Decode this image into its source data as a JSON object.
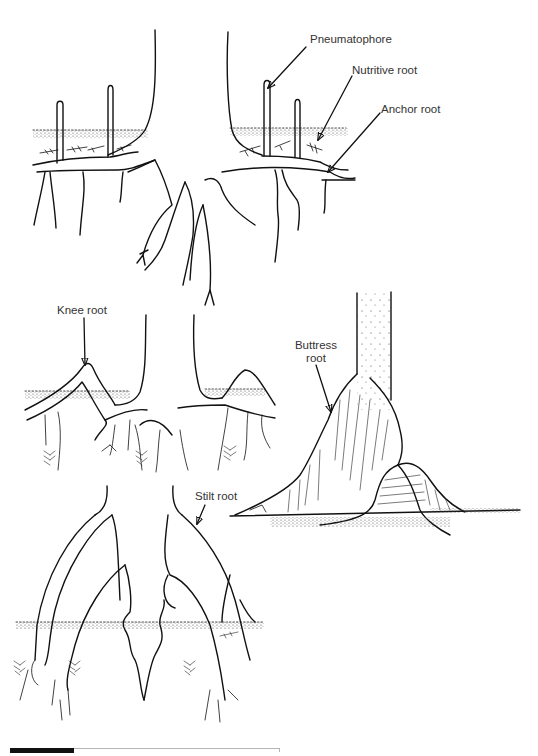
{
  "figure": {
    "panels": [
      {
        "id": "pneumatophore-panel",
        "labels": [
          "Pneumatophore",
          "Nutritive root",
          "Anchor root"
        ]
      },
      {
        "id": "knee-root-panel",
        "labels": [
          "Knee root"
        ]
      },
      {
        "id": "buttress-root-panel",
        "labels": [
          "Buttress root"
        ]
      },
      {
        "id": "stilt-root-panel",
        "labels": [
          "Stilt root"
        ]
      }
    ],
    "labels": {
      "pneumatophore": "Pneumatophore",
      "nutritive_root": "Nutritive root",
      "anchor_root": "Anchor root",
      "knee_root": "Knee root",
      "buttress_root_line1": "Buttress",
      "buttress_root_line2": "root",
      "stilt_root": "Stilt root"
    },
    "colors": {
      "ink": "#111111",
      "label_text": "#333333",
      "background": "#ffffff",
      "caption_bar_black": "#111111",
      "caption_bar_line": "#b5b5b5"
    }
  }
}
